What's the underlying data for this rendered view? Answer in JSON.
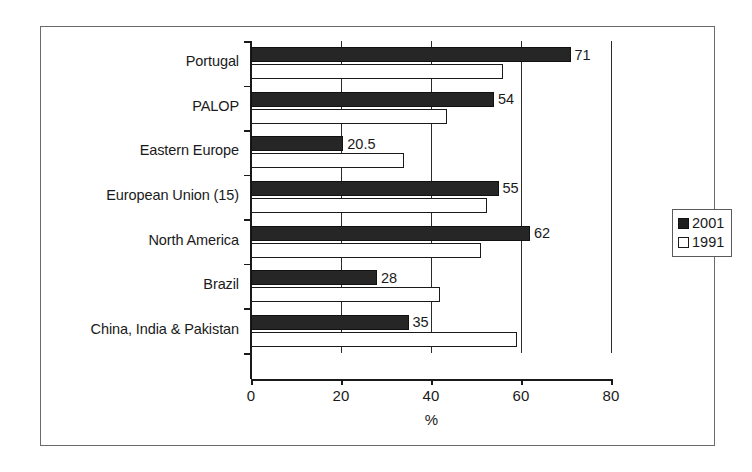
{
  "chart_data": {
    "type": "bar",
    "orientation": "horizontal",
    "title": "",
    "xlabel": "%",
    "ylabel": "",
    "xlim": [
      0,
      80
    ],
    "xticks": [
      0,
      20,
      40,
      60,
      80
    ],
    "xtick_labels": [
      "0",
      "20",
      "40",
      "60",
      "80"
    ],
    "grid": true,
    "grid_axis": "x",
    "legend_position": "right",
    "categories": [
      "Portugal",
      "PALOP",
      "Eastern Europe",
      "European Union (15)",
      "North America",
      "Brazil",
      "China, India & Pakistan"
    ],
    "series": [
      {
        "name": "2001",
        "color": "#262626",
        "values": [
          71,
          54,
          20.5,
          55,
          62,
          28,
          35
        ],
        "value_labels": [
          "71",
          "54",
          "20.5",
          "55",
          "62",
          "28",
          "35"
        ],
        "labels_shown": true
      },
      {
        "name": "1991",
        "color": "#ffffff",
        "values": [
          56,
          43.5,
          34,
          52.5,
          51,
          42,
          59
        ],
        "value_labels": [
          "",
          "",
          "",
          "",
          "",
          "",
          ""
        ],
        "labels_shown": false
      }
    ]
  },
  "legend": {
    "items": [
      {
        "label": "2001",
        "swatch": "filled-square-icon"
      },
      {
        "label": "1991",
        "swatch": "empty-square-icon"
      }
    ]
  }
}
